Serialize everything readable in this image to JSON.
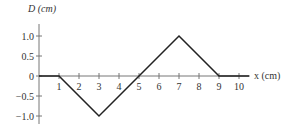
{
  "chart_data": {
    "type": "line",
    "title": "",
    "xlabel": "x (cm)",
    "ylabel": "D (cm)",
    "x": [
      0,
      1,
      3,
      5,
      7,
      9,
      10.5
    ],
    "values": [
      0,
      0,
      -1.0,
      0,
      1.0,
      0,
      0
    ],
    "xticks": [
      "1",
      "2",
      "3",
      "4",
      "5",
      "6",
      "7",
      "8",
      "9",
      "10"
    ],
    "yticks": [
      "1.0",
      "0.5",
      "0",
      "-0.5",
      "-1.0"
    ],
    "xlim": [
      0,
      10.5
    ],
    "ylim": [
      -1.2,
      1.3
    ],
    "grid": false
  },
  "labels": {
    "ylabel": "D (cm)",
    "xlabel": "x (cm)"
  }
}
